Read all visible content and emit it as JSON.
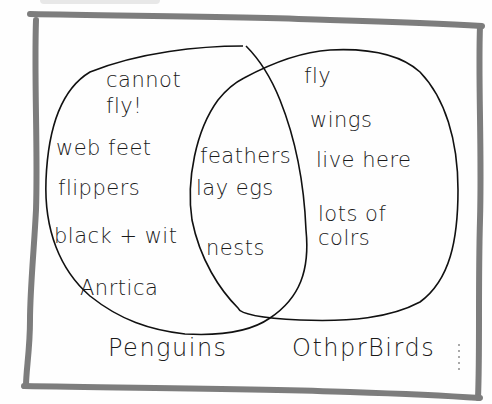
{
  "diagram": {
    "type": "venn",
    "sets": [
      {
        "name": "Penguins",
        "label": "Penguins",
        "items": [
          "cannot",
          "fly!",
          "web feet",
          "flippers",
          "black + wit",
          "Anrtica"
        ]
      },
      {
        "name": "Other Birds",
        "label": "OthprBirds",
        "items": [
          "fly",
          "wings",
          "live here",
          "lots of",
          "colrs"
        ]
      }
    ],
    "intersection": {
      "items": [
        "feathers",
        "lay egs",
        "nests"
      ]
    },
    "colors": {
      "ink": "#1a1a1a",
      "frame": "#6e6e6e",
      "background": "#ffffff"
    }
  }
}
